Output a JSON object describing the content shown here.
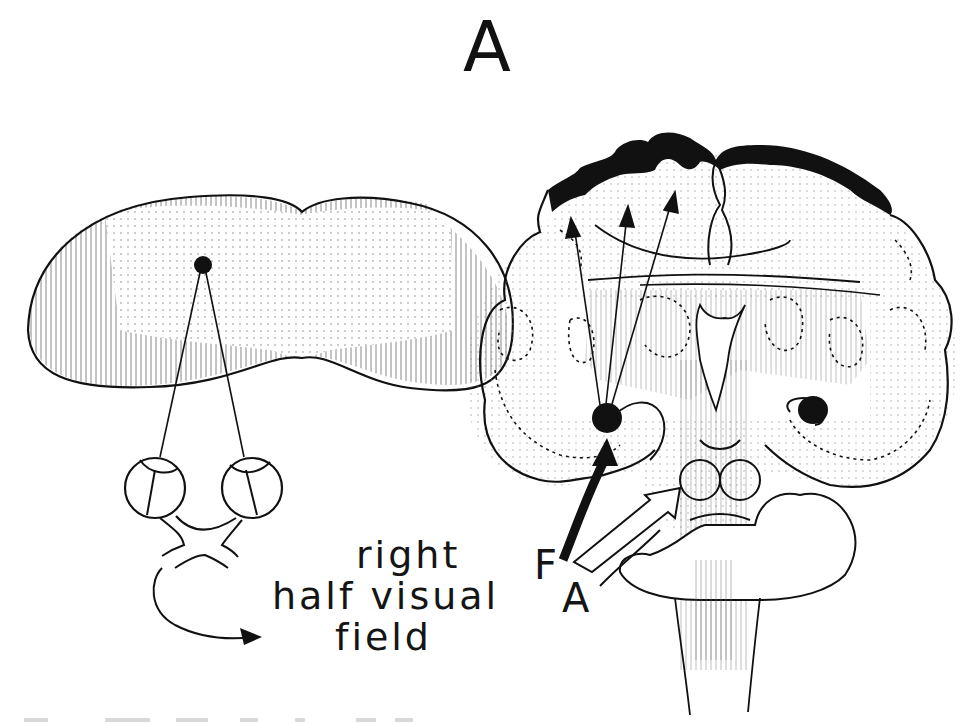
{
  "figure": {
    "panel_label": "A",
    "left_diagram": {
      "name": "visual-field-and-eyes",
      "label_lines": [
        "right",
        "half visual",
        "field"
      ]
    },
    "right_diagram": {
      "name": "coronal-brain-section",
      "arrow_labels": {
        "filled_arrow": "F",
        "open_arrow": "A"
      }
    },
    "caption": {
      "visible": "cropped, illegible"
    },
    "colors": {
      "ink": "#111111",
      "background": "#ffffff",
      "stipple": "#9a9a9a",
      "hatch": "#8a8a8a"
    }
  }
}
